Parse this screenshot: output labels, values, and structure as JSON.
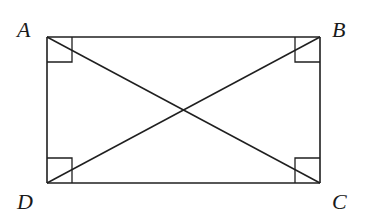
{
  "diagram": {
    "type": "geometry-figure",
    "shape": "rectangle",
    "vertices": [
      {
        "id": "A",
        "label": "A",
        "x": 47,
        "y": 37,
        "label_x": 17,
        "label_y": 37
      },
      {
        "id": "B",
        "label": "B",
        "x": 320,
        "y": 37,
        "label_x": 332,
        "label_y": 37
      },
      {
        "id": "C",
        "label": "C",
        "x": 320,
        "y": 183,
        "label_x": 332,
        "label_y": 209
      },
      {
        "id": "D",
        "label": "D",
        "x": 47,
        "y": 183,
        "label_x": 17,
        "label_y": 209
      }
    ],
    "edges": [
      {
        "from": "A",
        "to": "B"
      },
      {
        "from": "B",
        "to": "C"
      },
      {
        "from": "C",
        "to": "D"
      },
      {
        "from": "D",
        "to": "A"
      }
    ],
    "diagonals": [
      {
        "from": "A",
        "to": "C"
      },
      {
        "from": "B",
        "to": "D"
      }
    ],
    "right_angle_markers": [
      "A",
      "B",
      "C",
      "D"
    ],
    "right_angle_marker_size": 25,
    "stroke_color": "#1f1f1f",
    "background_color": "#ffffff"
  }
}
